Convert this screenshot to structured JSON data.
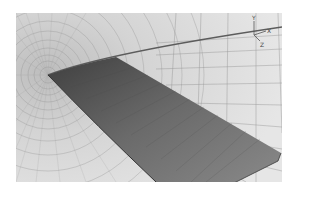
{
  "figure": {
    "colors": {
      "background": "#ffffff",
      "mesh_bg": "#dcdcdc",
      "mesh_line": "#9a9a9a",
      "wing_dark": "#555555",
      "wing_mid": "#7a7a7a",
      "wing_light": "#9b9b9b"
    }
  },
  "axes_triad": {
    "y_label": "Y",
    "x_label": "X",
    "z_label": "Z"
  }
}
